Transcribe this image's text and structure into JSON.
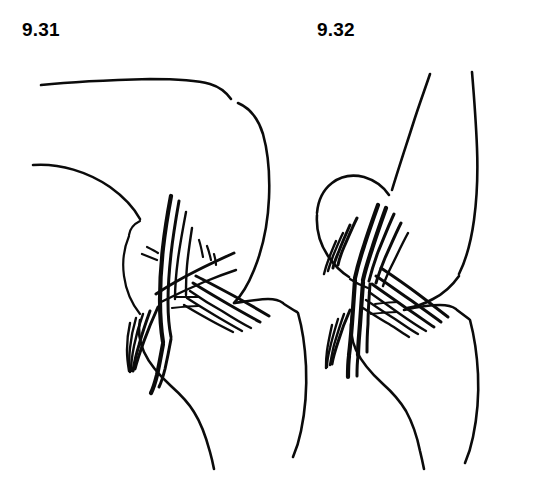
{
  "sheet": {
    "title": "Knee joint ligament line drawings",
    "background_color": "#ffffff",
    "ink_color": "#0b0b0b",
    "width": 552,
    "height": 500
  },
  "figures": [
    {
      "id": "fig-931",
      "label": "9.31",
      "caption_position": "top-left",
      "description": "Sagittal line drawing of an extended knee joint showing femur, patella, tibia and crossing cruciate ligament fibres"
    },
    {
      "id": "fig-932",
      "label": "9.32",
      "caption_position": "top-center-right",
      "description": "Sagittal line drawing of a flexed knee joint showing femoral condyle, tibia and a dense fan of ligament fibres"
    }
  ],
  "icons": {
    "figure_931_icon": "knee-extended-icon",
    "figure_932_icon": "knee-flexed-icon"
  }
}
